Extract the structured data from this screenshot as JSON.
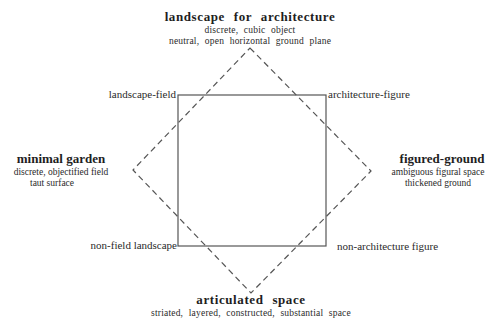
{
  "diagram": {
    "type": "semiotic-square",
    "square": {
      "stroke": "#555555",
      "corners": {
        "top_left": "landscape-field",
        "top_right": "architecture-figure",
        "bottom_left": "non-field landscape",
        "bottom_right": "non-architecture figure"
      }
    },
    "diamond": {
      "stroke": "#555555",
      "style": "dashed",
      "vertices": {
        "top": {
          "title": "landscape for architecture",
          "lines": [
            "discrete, cubic object",
            "neutral, open horizontal ground plane"
          ]
        },
        "left": {
          "title": "minimal garden",
          "lines": [
            "discrete, objectified field",
            "taut surface"
          ]
        },
        "right": {
          "title": "figured-ground",
          "lines": [
            "ambiguous figural space",
            "thickened ground"
          ]
        },
        "bottom": {
          "title": "articulated space",
          "lines": [
            "striated, layered, constructed, substantial space"
          ]
        }
      }
    }
  }
}
